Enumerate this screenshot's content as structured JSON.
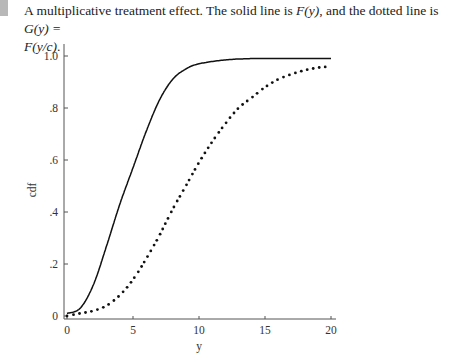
{
  "caption": {
    "text_part1": "A multiplicative treatment effect. The solid line is ",
    "f_of_y": "F(y)",
    "text_part2": ", and the dotted line is ",
    "g_of_y": "G(y) =",
    "f_of_y_over_c": "F(y/c)",
    "end": "."
  },
  "chart_data": {
    "type": "line",
    "title": "",
    "xlabel": "y",
    "ylabel": "cdf",
    "xlim": [
      0,
      20
    ],
    "ylim": [
      0,
      1.0
    ],
    "x_ticks": [
      "0",
      "5",
      "10",
      "15",
      "20"
    ],
    "y_ticks": [
      "0",
      ".2",
      ".4",
      ".6",
      ".8",
      "1.0"
    ],
    "grid": false,
    "legend": "none",
    "series": [
      {
        "name": "F(y)",
        "style": "solid",
        "x": [
          0,
          1,
          2,
          3,
          4,
          5,
          6,
          7,
          8,
          9,
          10,
          12,
          14,
          16,
          18,
          20
        ],
        "values": [
          0.01,
          0.03,
          0.12,
          0.27,
          0.43,
          0.57,
          0.71,
          0.83,
          0.91,
          0.95,
          0.97,
          0.985,
          0.99,
          0.99,
          0.99,
          0.99
        ]
      },
      {
        "name": "G(y) = F(y/c)",
        "style": "dotted",
        "x": [
          0,
          1,
          2,
          3,
          4,
          5,
          6,
          7,
          8,
          9,
          10,
          11,
          12,
          13,
          14,
          15,
          16,
          17,
          18,
          19,
          20
        ],
        "values": [
          0.0,
          0.01,
          0.02,
          0.04,
          0.08,
          0.14,
          0.22,
          0.31,
          0.41,
          0.5,
          0.59,
          0.67,
          0.74,
          0.8,
          0.84,
          0.88,
          0.91,
          0.93,
          0.945,
          0.955,
          0.96
        ]
      }
    ]
  }
}
